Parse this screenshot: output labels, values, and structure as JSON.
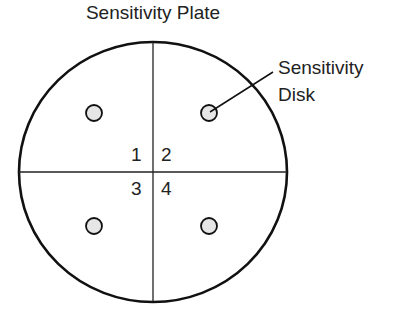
{
  "title": "Sensitivity Plate",
  "callout": {
    "line1": "Sensitivity",
    "line2": "Disk"
  },
  "quadrants": [
    "1",
    "2",
    "3",
    "4"
  ],
  "colors": {
    "stroke": "#111111",
    "disk_fill": "#e6e6e6",
    "text": "#222222"
  }
}
